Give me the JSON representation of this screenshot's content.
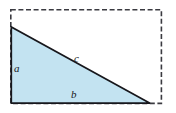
{
  "figure": {
    "name": "right-triangle-with-dashed-bounding-rectangle",
    "canvas": {
      "width": 176,
      "height": 113,
      "background": "#ffffff"
    },
    "bounding_box": {
      "name": "dashed-rectangle",
      "x": 10,
      "y": 9,
      "width": 152,
      "height": 95,
      "stroke": "#3a3a40",
      "stroke_width": 1.6,
      "dash": "5,2.6",
      "fill": "none"
    },
    "triangle": {
      "name": "right-triangle",
      "points": "11,27 11,103 150,103",
      "fill": "#c3e3f1",
      "stroke": "#17171c",
      "stroke_width": 1.7,
      "vertices": [
        {
          "name": "apex-top-left",
          "x": 11,
          "y": 27
        },
        {
          "name": "right-angle-bottom-left",
          "x": 11,
          "y": 103
        },
        {
          "name": "bottom-right",
          "x": 150,
          "y": 103
        }
      ]
    },
    "labels": [
      {
        "id": "a",
        "text": "a",
        "side": "vertical-leg",
        "x": 18,
        "y": 69
      },
      {
        "id": "c",
        "text": "c",
        "side": "hypotenuse",
        "x": 78,
        "y": 59
      },
      {
        "id": "b",
        "text": "b",
        "side": "horizontal-leg",
        "x": 75,
        "y": 95
      }
    ]
  }
}
